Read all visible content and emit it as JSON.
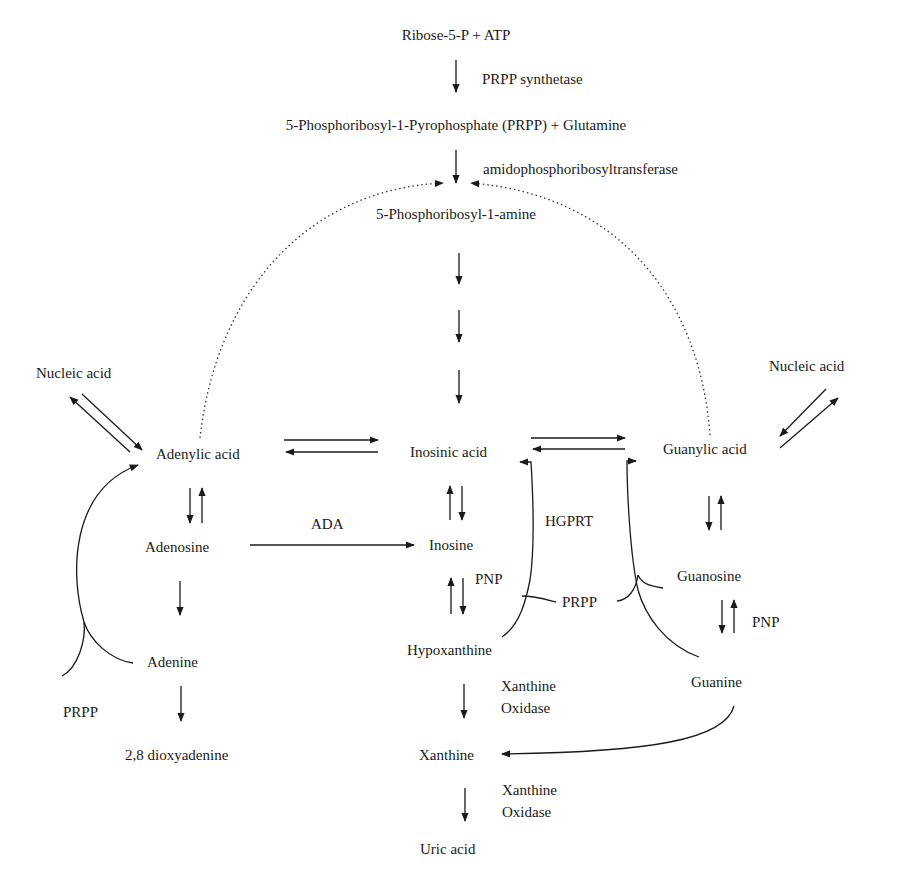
{
  "diagram": {
    "nodes": {
      "ribose": "Ribose-5-P + ATP",
      "prpp_glutamine": "5-Phosphoribosyl-1-Pyrophosphate (PRPP) + Glutamine",
      "phosphoribosylamine": "5-Phosphoribosyl-1-amine",
      "nucleic_acid_left": "Nucleic acid",
      "nucleic_acid_right": "Nucleic acid",
      "adenylic_acid": "Adenylic acid",
      "inosinic_acid": "Inosinic acid",
      "guanylic_acid": "Guanylic acid",
      "adenosine": "Adenosine",
      "inosine": "Inosine",
      "guanosine": "Guanosine",
      "adenine": "Adenine",
      "hypoxanthine": "Hypoxanthine",
      "guanine": "Guanine",
      "dioxyadenine": "2,8 dioxyadenine",
      "xanthine": "Xanthine",
      "uric_acid": "Uric acid"
    },
    "enzymes": {
      "prpp_synthetase": "PRPP synthetase",
      "amidophosphoribosyltransferase": "amidophosphoribosyltransferase",
      "ada": "ADA",
      "hgprt": "HGPRT",
      "pnp_inosine": "PNP",
      "pnp_guanosine": "PNP",
      "prpp_center": "PRPP",
      "prpp_left": "PRPP",
      "xanthine_oxidase_1_line1": "Xanthine",
      "xanthine_oxidase_1_line2": "Oxidase",
      "xanthine_oxidase_2_line1": "Xanthine",
      "xanthine_oxidase_2_line2": "Oxidase"
    }
  }
}
